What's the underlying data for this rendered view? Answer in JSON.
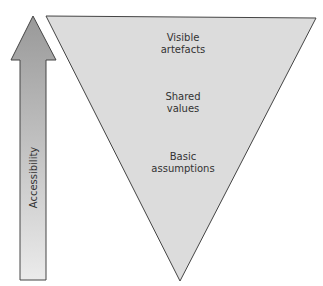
{
  "diagram": {
    "arrow_label": "Accessibility",
    "layers": [
      {
        "line1": "Visible",
        "line2": "artefacts"
      },
      {
        "line1": "Shared",
        "line2": "values"
      },
      {
        "line1": "Basic",
        "line2": "assumptions"
      }
    ],
    "colors": {
      "fill": "#dcdcdc",
      "stroke": "#444444",
      "arrow_top": "#9a9a9a",
      "arrow_bottom": "#e8e8e8"
    }
  }
}
